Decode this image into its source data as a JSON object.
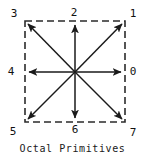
{
  "figure": {
    "caption": "Octal Primitives",
    "colors": {
      "arrow": "#1a1a1a",
      "border": "#2b2b2b",
      "label": "#111111",
      "background": "#ffffff"
    },
    "frame": {
      "left": 25,
      "top": 21,
      "right": 125,
      "bottom": 122,
      "border_style": "dashed",
      "dash_length": 7,
      "dash_gap": 4
    },
    "center": {
      "x": 75,
      "y": 72
    },
    "directions": [
      {
        "code": "0",
        "name": "east",
        "label_x": 133,
        "label_y": 71,
        "tip_x": 125,
        "tip_y": 72
      },
      {
        "code": "1",
        "name": "northeast",
        "label_x": 133,
        "label_y": 13,
        "tip_x": 125,
        "tip_y": 21
      },
      {
        "code": "2",
        "name": "north",
        "label_x": 74,
        "label_y": 12,
        "tip_x": 75,
        "tip_y": 21
      },
      {
        "code": "3",
        "name": "northwest",
        "label_x": 14,
        "label_y": 13,
        "tip_x": 25,
        "tip_y": 21
      },
      {
        "code": "4",
        "name": "west",
        "label_x": 11,
        "label_y": 71,
        "tip_x": 25,
        "tip_y": 72
      },
      {
        "code": "5",
        "name": "southwest",
        "label_x": 13,
        "label_y": 131,
        "tip_x": 25,
        "tip_y": 122
      },
      {
        "code": "6",
        "name": "south",
        "label_x": 75,
        "label_y": 129,
        "tip_x": 75,
        "tip_y": 122
      },
      {
        "code": "7",
        "name": "southeast",
        "label_x": 133,
        "label_y": 132,
        "tip_x": 125,
        "tip_y": 122
      }
    ]
  }
}
